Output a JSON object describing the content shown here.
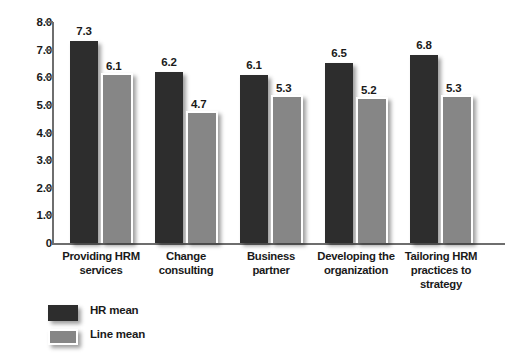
{
  "chart_data": {
    "type": "bar",
    "title": "",
    "xlabel": "",
    "ylabel": "",
    "ylim": [
      0,
      8
    ],
    "grid": false,
    "legend_position": "bottom-left",
    "categories": [
      "Providing HRM services",
      "Change consulting",
      "Business partner",
      "Developing the organization",
      "Tailoring HRM practices to strategy"
    ],
    "category_lines": [
      [
        "Providing HRM",
        "services"
      ],
      [
        "Change",
        "consulting"
      ],
      [
        "Business",
        "partner"
      ],
      [
        "Developing the",
        "organization"
      ],
      [
        "Tailoring HRM",
        "practices to",
        "strategy"
      ]
    ],
    "series": [
      {
        "name": "HR mean",
        "color": "#2d2d2d",
        "values": [
          7.3,
          6.2,
          6.1,
          6.5,
          6.8
        ]
      },
      {
        "name": "Line mean",
        "color": "#868686",
        "values": [
          6.1,
          4.7,
          5.3,
          5.2,
          5.3
        ]
      }
    ],
    "y_ticks": [
      "8.0",
      "7.0",
      "6.0",
      "5.0",
      "4.0",
      "3.0",
      "2.0",
      "1.0",
      "0"
    ],
    "y_tick_values": [
      8,
      7,
      6,
      5,
      4,
      3,
      2,
      1,
      0
    ]
  },
  "legend": {
    "items": [
      {
        "label": "HR mean"
      },
      {
        "label": "Line mean"
      }
    ]
  }
}
